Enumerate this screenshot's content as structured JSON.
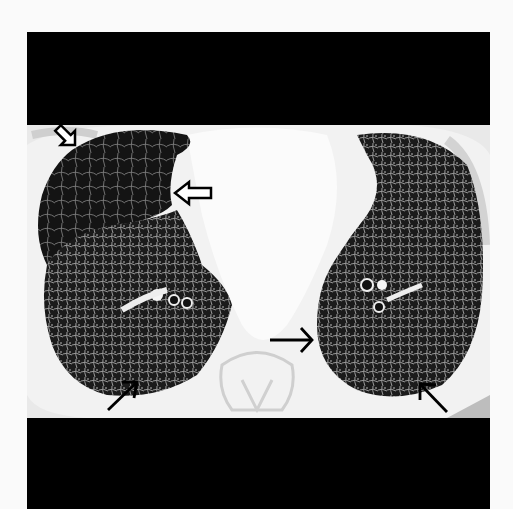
{
  "image": {
    "type": "axial chest CT, lung window",
    "background": "#fafafa",
    "frame_color": "#000000",
    "annotations": [
      {
        "kind": "open-arrow",
        "label": "open arrow upper-left pleura",
        "x": 75,
        "y": 145
      },
      {
        "kind": "open-arrow",
        "label": "open arrow right mid lung fissure",
        "x": 177,
        "y": 193
      },
      {
        "kind": "arrow",
        "label": "arrow right posterior lung",
        "x": 138,
        "y": 380
      },
      {
        "kind": "arrow",
        "label": "arrow left posterior medial lung",
        "x": 313,
        "y": 340
      },
      {
        "kind": "arrow",
        "label": "arrow left posterior lateral lung",
        "x": 420,
        "y": 385
      }
    ]
  }
}
